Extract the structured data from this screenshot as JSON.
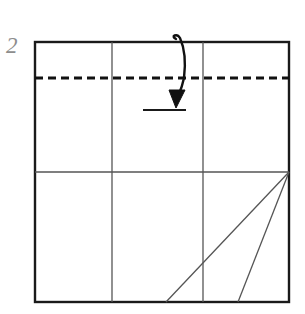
{
  "figure": {
    "kind": "origami-fold-diagram",
    "step_label": "2",
    "background_color": "#ffffff",
    "outline_color": "#1a1a1a",
    "crease_color": "#555555",
    "dashed_color": "#111111",
    "arrow_color": "#111111",
    "step_label_color": "#8d8d8d"
  },
  "chart_data": {
    "type": "diagram",
    "title": "2",
    "xlabel": "",
    "ylabel": "",
    "paper_square": {
      "left": 35,
      "top": 42,
      "right": 289,
      "bottom": 302,
      "stroke_width": 2.4
    },
    "crease_lines": [
      {
        "name": "vertical-crease-left",
        "x1": 112,
        "y1": 42,
        "x2": 112,
        "y2": 302
      },
      {
        "name": "vertical-crease-right",
        "x1": 203,
        "y1": 42,
        "x2": 203,
        "y2": 302
      },
      {
        "name": "horizontal-crease-middle",
        "x1": 35,
        "y1": 172,
        "x2": 289,
        "y2": 172
      },
      {
        "name": "diagonal-crease-long",
        "x1": 289,
        "y1": 172,
        "x2": 166,
        "y2": 302
      },
      {
        "name": "diagonal-crease-short",
        "x1": 289,
        "y1": 172,
        "x2": 238,
        "y2": 302
      }
    ],
    "fold_line": {
      "name": "dashed-fold-line",
      "x1": 35,
      "y1": 78,
      "x2": 289,
      "y2": 78,
      "style": "dashed",
      "dash": "8 5",
      "stroke_width": 3
    },
    "target_line": {
      "name": "fold-target-line",
      "x1": 143,
      "y1": 110,
      "x2": 186,
      "y2": 110,
      "stroke_width": 1.8
    },
    "fold_arrow": {
      "name": "fold-down-arrow",
      "path": "M 176 39 C 170 36 177 33 180 38 C 184 47 186 62 184 78 C 182 88 179 94 177 99",
      "head": "176,108 169,90 185,90",
      "stroke_width": 2.4,
      "direction": "down"
    }
  }
}
